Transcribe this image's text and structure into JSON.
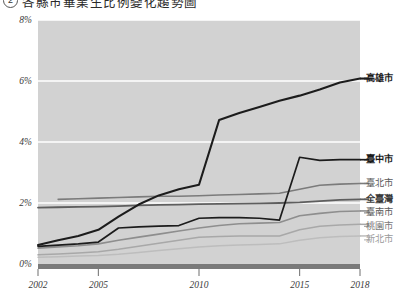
{
  "caption": {
    "badge": "2",
    "text": "各縣市畢業生比例變化趨勢圖"
  },
  "chart_data": {
    "type": "line",
    "title": "",
    "xlabel": "",
    "ylabel": "",
    "xlim": [
      2002,
      2018
    ],
    "ylim": [
      0,
      8
    ],
    "grid": true,
    "grid_axis": "y",
    "legend_position": "right",
    "plot_background": "#d2d2d2",
    "gridline_color": "#ffffff",
    "axis_color": "#7a7a7a",
    "y_ticks": [
      0,
      2,
      4,
      6,
      8
    ],
    "y_tick_labels": [
      "0%",
      "2%",
      "4%",
      "6%",
      "8%"
    ],
    "x_ticks": [
      2002,
      2005,
      2010,
      2015,
      2018
    ],
    "x_tick_labels": [
      "2002",
      "2005",
      "2010",
      "2015",
      "2018"
    ],
    "x": [
      2002,
      2003,
      2004,
      2005,
      2006,
      2007,
      2008,
      2009,
      2010,
      2011,
      2012,
      2013,
      2014,
      2015,
      2016,
      2017,
      2018
    ],
    "series": [
      {
        "name": "高雄市",
        "color": "#1c1c1c",
        "width": 2.1,
        "label_color": "#1c1c1c",
        "label_weight": "bold",
        "values": [
          0.62,
          0.78,
          0.92,
          1.12,
          1.55,
          1.95,
          2.25,
          2.45,
          2.6,
          4.72,
          4.95,
          5.15,
          5.35,
          5.52,
          5.72,
          5.95,
          6.08
        ]
      },
      {
        "name": "臺中市",
        "color": "#1c1c1c",
        "width": 1.7,
        "label_color": "#1c1c1c",
        "label_weight": "bold",
        "values": [
          0.58,
          0.62,
          0.66,
          0.72,
          1.18,
          1.22,
          1.24,
          1.26,
          1.5,
          1.52,
          1.52,
          1.5,
          1.44,
          3.5,
          3.4,
          3.42,
          3.42
        ]
      },
      {
        "name": "臺北市",
        "color": "#7b7b7b",
        "width": 1.6,
        "label_color": "#5a5a5a",
        "label_weight": "normal",
        "values": [
          null,
          2.12,
          2.14,
          2.16,
          2.18,
          2.2,
          2.22,
          2.22,
          2.24,
          2.26,
          2.28,
          2.3,
          2.32,
          2.45,
          2.58,
          2.62,
          2.64
        ]
      },
      {
        "name": "全臺灣",
        "color": "#5e5e5e",
        "width": 1.8,
        "label_color": "#3a3a3a",
        "label_weight": "bold",
        "values": [
          1.85,
          1.86,
          1.87,
          1.88,
          1.9,
          1.92,
          1.94,
          1.95,
          1.96,
          1.97,
          1.98,
          1.99,
          2.0,
          2.02,
          2.06,
          2.1,
          2.12
        ]
      },
      {
        "name": "臺南市",
        "color": "#8e8e8e",
        "width": 1.6,
        "label_color": "#5a5a5a",
        "label_weight": "normal",
        "values": [
          0.52,
          0.56,
          0.6,
          0.66,
          0.78,
          0.88,
          0.98,
          1.08,
          1.18,
          1.26,
          1.32,
          1.34,
          1.36,
          1.58,
          1.66,
          1.72,
          1.74
        ]
      },
      {
        "name": "桃園市",
        "color": "#a8a8a8",
        "width": 1.5,
        "label_color": "#7a7a7a",
        "label_weight": "normal",
        "values": [
          0.3,
          0.33,
          0.36,
          0.4,
          0.48,
          0.58,
          0.68,
          0.78,
          0.88,
          0.9,
          0.92,
          0.92,
          0.92,
          1.12,
          1.24,
          1.28,
          1.3
        ]
      },
      {
        "name": "新北市",
        "color": "#bdbdbd",
        "width": 1.5,
        "label_color": "#9a9a9a",
        "label_weight": "normal",
        "values": [
          0.22,
          0.24,
          0.26,
          0.28,
          0.32,
          0.38,
          0.44,
          0.5,
          0.56,
          0.6,
          0.62,
          0.64,
          0.66,
          0.78,
          0.86,
          0.9,
          0.92
        ]
      }
    ]
  }
}
